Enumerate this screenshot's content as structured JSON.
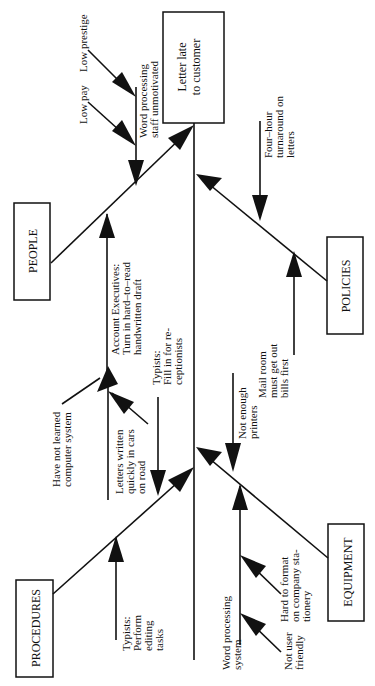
{
  "diagram": {
    "type": "fishbone",
    "orientation": "rotated-90-ccw",
    "effect": {
      "line1": "Letter late",
      "line2": "to customer"
    },
    "categories": {
      "people": {
        "label": "PEOPLE",
        "causes": {
          "unmotivated": {
            "line1": "Word processing",
            "line2": "staff unmotivated",
            "sub_causes": [
              "Low prestige",
              "Low pay"
            ]
          },
          "account_execs": {
            "line1": "Account Executives:",
            "line2": "Turn in hard–to–read",
            "line3": "handwritten draft"
          }
        }
      },
      "procedures": {
        "label": "PROCEDURES",
        "causes": {
          "not_learned": {
            "line1": "Have not learned",
            "line2": "computer system"
          },
          "letters_written": {
            "line1": "Letters written",
            "line2": "quickly in cars",
            "line3": "on road"
          },
          "typists_fill": {
            "line1": "Typists:",
            "line2": "Fill in for re-",
            "line3": "ceptionists"
          },
          "typists_edit": {
            "line1": "Typists:",
            "line2": "Perform",
            "line3": "editing",
            "line4": "tasks"
          }
        }
      },
      "policies": {
        "label": "POLICIES",
        "causes": {
          "four_hour": {
            "line1": "Four–hour",
            "line2": "turnaround on",
            "line3": "letters"
          },
          "mail_room": {
            "line1": "Mail room",
            "line2": "must get out",
            "line3": "bills first"
          }
        }
      },
      "equipment": {
        "label": "EQUIPMENT",
        "causes": {
          "not_enough_printers": {
            "line1": "Not enough",
            "line2": "printers"
          },
          "wp_system": {
            "line1": "Word processing",
            "line2": "system",
            "sub_causes": {
              "hard_format": {
                "line1": "Hard to format",
                "line2": "on company sta-",
                "line3": "tionery"
              },
              "not_friendly": {
                "line1": "Not user",
                "line2": "friendly"
              }
            }
          }
        }
      }
    }
  }
}
